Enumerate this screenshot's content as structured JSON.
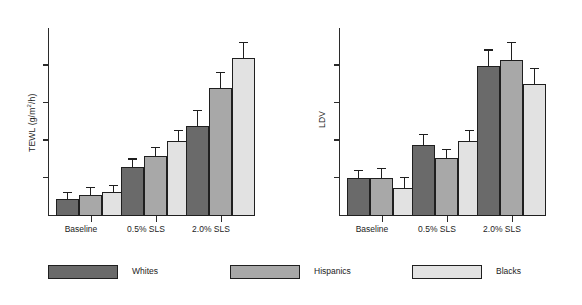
{
  "figure": {
    "background": "#ffffff",
    "panels": [
      "TEWL",
      "LDV"
    ]
  },
  "legend": {
    "position": "bottom",
    "items": [
      {
        "label": "Whites",
        "color": "#6a6a6a"
      },
      {
        "label": "Hispanics",
        "color": "#a8a8a8"
      },
      {
        "label": "Blacks",
        "color": "#e2e2e2"
      }
    ]
  },
  "chart_data": [
    {
      "type": "bar",
      "title": "",
      "ylabel": "TEWL (g/m²/h)",
      "ylabel_text": "TEWL (g/m",
      "ylabel_sup": "2",
      "ylabel_tail": "/h)",
      "xlabel": "",
      "categories": [
        "Baseline",
        "0.5% SLS",
        "2.0% SLS"
      ],
      "grid": false,
      "legend_position": "bottom",
      "ylim": [
        0,
        100
      ],
      "yticks": [
        20,
        40,
        60,
        80
      ],
      "series": [
        {
          "name": "Whites",
          "color": "#6a6a6a",
          "values": [
            9,
            26,
            48
          ],
          "errors": [
            3,
            4,
            8
          ]
        },
        {
          "name": "Hispanics",
          "color": "#a8a8a8",
          "values": [
            11,
            32,
            68
          ],
          "errors": [
            4,
            4,
            8
          ]
        },
        {
          "name": "Blacks",
          "color": "#e2e2e2",
          "values": [
            13,
            40,
            84
          ],
          "errors": [
            3,
            5,
            8
          ]
        }
      ]
    },
    {
      "type": "bar",
      "title": "",
      "ylabel": "LDV",
      "xlabel": "",
      "categories": [
        "Baseline",
        "0.5% SLS",
        "2.0% SLS"
      ],
      "grid": false,
      "legend_position": "bottom",
      "ylim": [
        0,
        100
      ],
      "yticks": [
        20,
        40,
        60,
        80
      ],
      "series": [
        {
          "name": "Whites",
          "color": "#6a6a6a",
          "values": [
            20,
            38,
            80
          ],
          "errors": [
            4,
            5,
            8
          ]
        },
        {
          "name": "Hispanics",
          "color": "#a8a8a8",
          "values": [
            20,
            31,
            83
          ],
          "errors": [
            5,
            4,
            9
          ]
        },
        {
          "name": "Blacks",
          "color": "#e2e2e2",
          "values": [
            15,
            40,
            70
          ],
          "errors": [
            5,
            5,
            8
          ]
        }
      ]
    }
  ]
}
